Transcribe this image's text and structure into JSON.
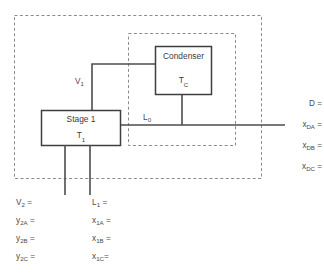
{
  "diagram": {
    "type": "process-flow-diagram",
    "colors": {
      "line": "#4d4d4d",
      "box_border": "#3f3f3f",
      "dashed_boundary": "#8c8c8c",
      "text": "#4a4a4a",
      "background": "#ffffff"
    },
    "units": [
      {
        "id": "stage-1",
        "name": "Stage 1",
        "temperature_label": "T",
        "temperature_sub": "1"
      },
      {
        "id": "condenser",
        "name": "Condenser",
        "temperature_label": "T",
        "temperature_sub": "C"
      }
    ],
    "streams": [
      {
        "id": "v1",
        "label": "V",
        "sub": "1"
      },
      {
        "id": "l0",
        "label": "L",
        "sub": "0"
      }
    ],
    "boundaries": [
      {
        "id": "overall-envelope",
        "style": "dashed"
      },
      {
        "id": "condenser-envelope",
        "style": "dashed"
      }
    ],
    "bottom_left_column": [
      {
        "symbol": "V",
        "sub": "2",
        "suffix": " ="
      },
      {
        "symbol": "y",
        "sub": "2A",
        "suffix": " ="
      },
      {
        "symbol": "y",
        "sub": "2B",
        "suffix": " ="
      },
      {
        "symbol": "y",
        "sub": "2C",
        "suffix": " ="
      }
    ],
    "bottom_right_column": [
      {
        "symbol": "L",
        "sub": "1",
        "suffix": " ="
      },
      {
        "symbol": "x",
        "sub": "1A",
        "suffix": " ="
      },
      {
        "symbol": "x",
        "sub": "1B",
        "suffix": " ="
      },
      {
        "symbol": "x",
        "sub": "1C",
        "suffix": "="
      }
    ],
    "right_column": [
      {
        "symbol": "D",
        "sub": "",
        "suffix": " ="
      },
      {
        "symbol": "x",
        "sub": "DA",
        "suffix": " ="
      },
      {
        "symbol": "x",
        "sub": "DB",
        "suffix": " ="
      },
      {
        "symbol": "x",
        "sub": "DC",
        "suffix": " ="
      }
    ]
  }
}
